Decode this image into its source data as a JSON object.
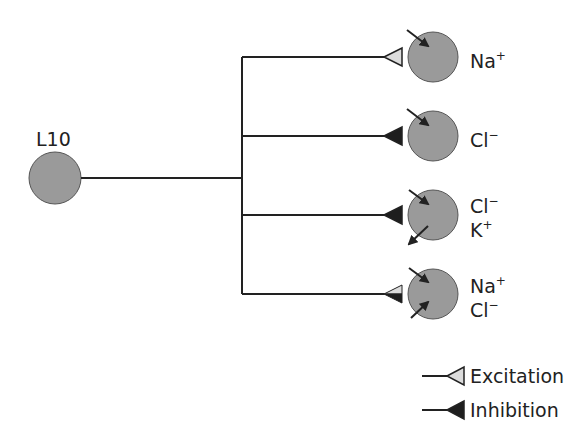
{
  "source_neuron": {
    "label": "L10",
    "color": "#9a9a9a"
  },
  "targets": [
    {
      "synapse": "excitation",
      "ions": [
        {
          "ion": "Na",
          "charge": "+",
          "direction": "in"
        }
      ]
    },
    {
      "synapse": "inhibition",
      "ions": [
        {
          "ion": "Cl",
          "charge": "−",
          "direction": "in"
        }
      ]
    },
    {
      "synapse": "inhibition",
      "ions": [
        {
          "ion": "Cl",
          "charge": "−",
          "direction": "in"
        },
        {
          "ion": "K",
          "charge": "+",
          "direction": "out"
        }
      ]
    },
    {
      "synapse": "mixed",
      "ions": [
        {
          "ion": "Na",
          "charge": "+",
          "direction": "in"
        },
        {
          "ion": "Cl",
          "charge": "−",
          "direction": "in"
        }
      ]
    }
  ],
  "legend": {
    "excitation": "Excitation",
    "inhibition": "Inhibition"
  },
  "colors": {
    "excitatory_fill": "#dcdcdc",
    "inhibitory_fill": "#1e1e1e",
    "neuron_fill": "#9a9a9a",
    "line": "#222222"
  }
}
